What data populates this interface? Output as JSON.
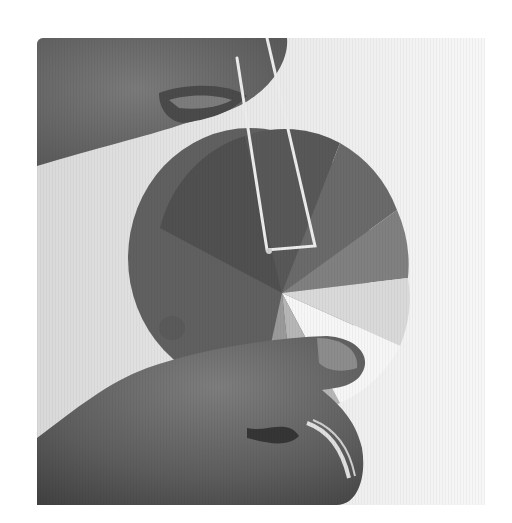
{
  "image": {
    "description": "Grayscale photograph of two hands holding a circular paper pie wheel with shaded wedge segments; a loop of white string hangs from the upper hand and attaches at the wheel's center.",
    "palette": {
      "background": "#ffffff",
      "backdrop_light": "#ececec",
      "skin_dark": "#4a4a4a",
      "skin_mid": "#6e6e6e",
      "wheel_dark": "#555555",
      "wheel_mid": "#7a7a7a",
      "wheel_light": "#a8a8a8",
      "wheel_pale": "#c9c9c9",
      "wheel_white": "#f4f4f4",
      "string": "#e8e8e8"
    },
    "wheel_segments": [
      {
        "name": "dark-upper-left",
        "shade": "#4f4f4f"
      },
      {
        "name": "darker-top",
        "shade": "#5a5a5a"
      },
      {
        "name": "upper-right-1",
        "shade": "#686868"
      },
      {
        "name": "upper-right-2",
        "shade": "#7e7e7e"
      },
      {
        "name": "right",
        "shade": "#d8d8d8"
      },
      {
        "name": "white-wedge",
        "shade": "#f6f6f6"
      },
      {
        "name": "lower-light",
        "shade": "#b5b5b5"
      },
      {
        "name": "lower-mid",
        "shade": "#9a9a9a"
      },
      {
        "name": "left-large",
        "shade": "#606060"
      }
    ]
  }
}
